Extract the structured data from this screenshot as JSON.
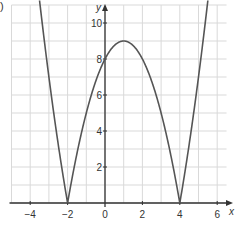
{
  "part_label": ")",
  "chart_data": {
    "type": "line",
    "title": "",
    "xlabel": "x",
    "ylabel": "y",
    "function": "y = |x^2 - 2x - 8|",
    "xlim": [
      -5,
      6.5
    ],
    "ylim": [
      0,
      11
    ],
    "grid": true,
    "x_ticks": [
      -4,
      -2,
      0,
      2,
      4,
      6
    ],
    "x_tick_labels": [
      "−4",
      "−2",
      "0",
      "2",
      "4",
      "6"
    ],
    "y_ticks": [
      2,
      4,
      6,
      8,
      10
    ],
    "y_tick_labels": [
      "2",
      "4",
      "6",
      "8",
      "10"
    ],
    "key_points": [
      {
        "x": -2,
        "y": 0,
        "label": "root"
      },
      {
        "x": 0,
        "y": 8,
        "label": "y-intercept"
      },
      {
        "x": 1,
        "y": 9,
        "label": "local maximum"
      },
      {
        "x": 4,
        "y": 0,
        "label": "root"
      }
    ],
    "series": [
      {
        "name": "y = |x^2 - 2x - 8|",
        "x": [
          -3.5,
          -3,
          -2.5,
          -2,
          -1.5,
          -1,
          -0.5,
          0,
          0.5,
          1,
          1.5,
          2,
          2.5,
          3,
          3.5,
          4,
          4.5,
          5,
          5.5
        ],
        "y": [
          11.25,
          7,
          3.25,
          0,
          2.75,
          5,
          6.75,
          8,
          8.75,
          9,
          8.75,
          8,
          6.75,
          5,
          2.75,
          0,
          3.25,
          7,
          11.25
        ]
      }
    ],
    "colors": {
      "curve": "#555555",
      "grid": "#d9d9d9",
      "axis": "#333333"
    }
  }
}
